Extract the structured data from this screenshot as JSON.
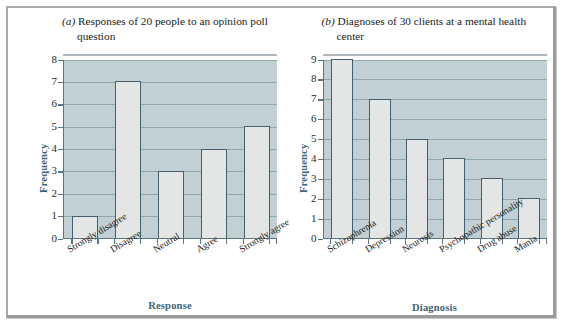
{
  "figure": {
    "panels": [
      {
        "tag": "(a)",
        "title_line1": "Responses of 20 people to an opinion poll",
        "title_line2": "question",
        "ylabel": "Frequency",
        "xlabel": "Response"
      },
      {
        "tag": "(b)",
        "title_line1": "Diagnoses of 30 clients at a mental health",
        "title_line2": "center",
        "ylabel": "Frequency",
        "xlabel": "Diagnosis"
      }
    ]
  },
  "colors": {
    "plot_background": "#c3d0d3",
    "bar_fill": "#e3e6e4",
    "bar_border": "#44606e",
    "gridline": "#8fa6ad",
    "axis_label": "#3e6479",
    "frame": "#a9a9a9"
  },
  "chart_data": [
    {
      "type": "bar",
      "title": "(a) Responses of 20 people to an opinion poll question",
      "categories": [
        "Strongly disagree",
        "Disagree",
        "Neutral",
        "Agree",
        "Strongly agree"
      ],
      "values": [
        1,
        7,
        3,
        4,
        5
      ],
      "xlabel": "Response",
      "ylabel": "Frequency",
      "ylim": [
        0,
        8
      ],
      "yticks": [
        0,
        1,
        2,
        3,
        4,
        5,
        6,
        7,
        8
      ],
      "ytick_labels": [
        "0",
        "1",
        "2",
        "3",
        "4",
        "5",
        "6",
        "7",
        "8"
      ],
      "grid": true,
      "legend": false
    },
    {
      "type": "bar",
      "title": "(b) Diagnoses of 30 clients at a mental health center",
      "categories": [
        "Schizophrenia",
        "Depression",
        "Neurosis",
        "Psychopathic personality",
        "Drug abuse",
        "Mania"
      ],
      "values": [
        9,
        7,
        5,
        4,
        3,
        2
      ],
      "xlabel": "Diagnosis",
      "ylabel": "Frequency",
      "ylim": [
        0,
        9
      ],
      "yticks": [
        0,
        1,
        2,
        3,
        4,
        5,
        6,
        7,
        8,
        9
      ],
      "ytick_labels": [
        "0",
        "1",
        "2",
        "3",
        "4",
        "5",
        "6",
        "7",
        "8",
        "9"
      ],
      "grid": true,
      "legend": false
    }
  ]
}
